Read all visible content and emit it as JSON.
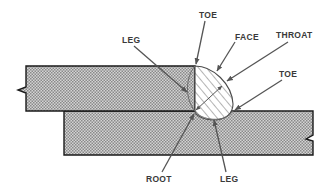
{
  "diagram": {
    "type": "fillet-weld-lap-joint",
    "labels": {
      "leg_top": "LEG",
      "toe_top": "TOE",
      "face": "FACE",
      "throat": "THROAT",
      "toe_right": "TOE",
      "root": "ROOT",
      "leg_bottom": "LEG"
    },
    "colors": {
      "plate_fill": "#b8b8b8",
      "outline": "#1a1a1a",
      "leader": "#555555",
      "label": "#3a3a3a"
    }
  }
}
